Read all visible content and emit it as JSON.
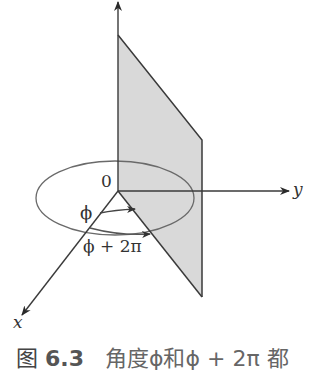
{
  "figure": {
    "axes": {
      "x_label": "x",
      "y_label": "y",
      "origin_label": "0"
    },
    "angles": {
      "inner_label": "ϕ",
      "outer_label": "ϕ + 2π"
    },
    "colors": {
      "line": "#3a3a3a",
      "plane_fill": "#d9d9d9",
      "ellipse": "#666666",
      "arrow_arc": "#555555"
    }
  },
  "caption": {
    "figure_word": "图",
    "number": "6.3",
    "text": "角度ϕ和ϕ + 2π 都"
  }
}
